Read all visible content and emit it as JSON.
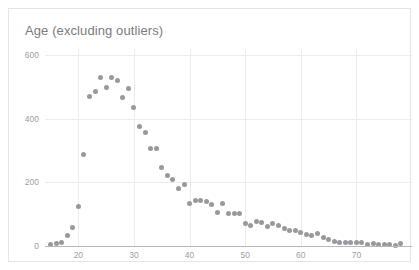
{
  "chart": {
    "title": "Age (excluding outliers)",
    "point_color": "#8f9094",
    "grid_color": "#ececec",
    "axis_color": "#b9b9b9",
    "label_color": "#a0a0a0",
    "border_color": "#e4e4e4",
    "background": "#ffffff"
  },
  "chart_data": {
    "type": "scatter",
    "title": "Age (excluding outliers)",
    "xlabel": "",
    "ylabel": "",
    "xlim": [
      14,
      80
    ],
    "ylim": [
      0,
      620
    ],
    "grid": true,
    "legend": false,
    "xticks": [
      20,
      30,
      40,
      50,
      60,
      70
    ],
    "yticks": [
      0,
      200,
      400,
      600
    ],
    "xtick_labels": [
      "20",
      "30",
      "40",
      "50",
      "60",
      "70"
    ],
    "ytick_labels": [
      "0",
      "200",
      "400",
      "600"
    ],
    "series": [
      {
        "name": "Age count",
        "x": [
          15,
          16,
          17,
          18,
          19,
          20,
          21,
          22,
          23,
          24,
          25,
          26,
          27,
          28,
          29,
          30,
          31,
          32,
          33,
          34,
          35,
          36,
          37,
          38,
          39,
          40,
          41,
          42,
          43,
          44,
          45,
          46,
          47,
          48,
          49,
          50,
          51,
          52,
          53,
          54,
          55,
          56,
          57,
          58,
          59,
          60,
          61,
          62,
          63,
          64,
          65,
          66,
          67,
          68,
          69,
          70,
          71,
          72,
          73,
          74,
          75,
          76,
          77,
          78
        ],
        "y": [
          4,
          8,
          10,
          34,
          58,
          124,
          288,
          472,
          486,
          530,
          498,
          530,
          522,
          468,
          496,
          436,
          376,
          356,
          306,
          308,
          248,
          222,
          208,
          182,
          192,
          134,
          144,
          142,
          140,
          130,
          104,
          134,
          102,
          102,
          102,
          70,
          66,
          78,
          74,
          60,
          70,
          66,
          56,
          50,
          48,
          44,
          36,
          32,
          38,
          28,
          22,
          14,
          10,
          10,
          10,
          10,
          10,
          6,
          8,
          6,
          4,
          4,
          2,
          8
        ]
      }
    ]
  }
}
